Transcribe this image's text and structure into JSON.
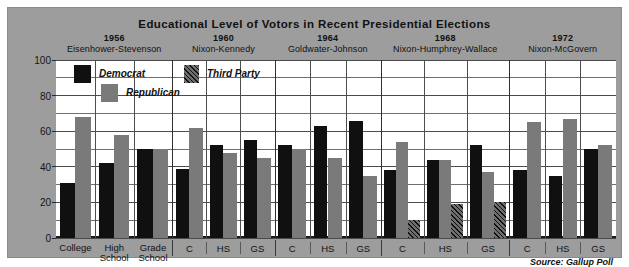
{
  "chart_data": {
    "type": "bar",
    "title": "Educational Level of Votors in Recent Presidential Elections",
    "xlabel": "",
    "ylabel": "",
    "ylim": [
      0,
      100
    ],
    "yticks": [
      0,
      20,
      40,
      60,
      80,
      100
    ],
    "ytick_labels": [
      "0",
      "20",
      "40",
      "60",
      "80",
      "100"
    ],
    "gridline_step": 10,
    "grid": true,
    "legend_position": "inside-top-left",
    "source": "Source: Gallup Poll",
    "series": [
      {
        "name": "Democrat",
        "key": "dem",
        "color": "#101010",
        "pattern": "solid"
      },
      {
        "name": "Republican",
        "key": "rep",
        "color": "#7a7a7a",
        "pattern": "solid"
      },
      {
        "name": "Third Party",
        "key": "third",
        "color": "#6e6e6e",
        "pattern": "diagonal-hatch"
      }
    ],
    "groups": [
      {
        "year": "1956",
        "candidates": "Eisenhower-Stevenson",
        "categories": [
          "College",
          "High School",
          "Grade School"
        ],
        "category_short": [
          "College",
          "High School",
          "Grade School"
        ],
        "bars": [
          {
            "category": "College",
            "dem": 31,
            "rep": 68
          },
          {
            "category": "High School",
            "dem": 42,
            "rep": 58
          },
          {
            "category": "Grade School",
            "dem": 50,
            "rep": 50
          }
        ]
      },
      {
        "year": "1960",
        "candidates": "Nixon-Kennedy",
        "categories": [
          "C",
          "HS",
          "GS"
        ],
        "category_short": [
          "C",
          "HS",
          "GS"
        ],
        "bars": [
          {
            "category": "C",
            "dem": 39,
            "rep": 62
          },
          {
            "category": "HS",
            "dem": 52,
            "rep": 48
          },
          {
            "category": "GS",
            "dem": 55,
            "rep": 45
          }
        ]
      },
      {
        "year": "1964",
        "candidates": "Goldwater-Johnson",
        "categories": [
          "C",
          "HS",
          "GS"
        ],
        "category_short": [
          "C",
          "HS",
          "GS"
        ],
        "bars": [
          {
            "category": "C",
            "dem": 52,
            "rep": 50
          },
          {
            "category": "HS",
            "dem": 63,
            "rep": 45
          },
          {
            "category": "GS",
            "dem": 66,
            "rep": 35
          }
        ]
      },
      {
        "year": "1968",
        "candidates": "Nixon-Humphrey-Wallace",
        "categories": [
          "C",
          "HS",
          "GS"
        ],
        "category_short": [
          "C",
          "HS",
          "GS"
        ],
        "bars": [
          {
            "category": "C",
            "dem": 38,
            "rep": 54,
            "third": 10
          },
          {
            "category": "HS",
            "dem": 44,
            "rep": 44,
            "third": 19
          },
          {
            "category": "GS",
            "dem": 52,
            "rep": 37,
            "third": 20
          }
        ]
      },
      {
        "year": "1972",
        "candidates": "Nixon-McGovern",
        "categories": [
          "C",
          "HS",
          "GS"
        ],
        "category_short": [
          "C",
          "HS",
          "GS"
        ],
        "bars": [
          {
            "category": "C",
            "dem": 38,
            "rep": 65
          },
          {
            "category": "HS",
            "dem": 35,
            "rep": 67
          },
          {
            "category": "GS",
            "dem": 50,
            "rep": 52
          }
        ]
      }
    ],
    "first_group_xlabels": [
      {
        "line1": "College",
        "line2": ""
      },
      {
        "line1": "High",
        "line2": "School"
      },
      {
        "line1": "Grade",
        "line2": "School"
      }
    ]
  },
  "colors": {
    "panel_background": "#9d9d9d",
    "plot_background": "#ffffff",
    "democrat": "#101010",
    "republican": "#7a7a7a",
    "third_party": "#6e6e6e",
    "gridline": "#6f6f6f",
    "text": "#111111"
  }
}
